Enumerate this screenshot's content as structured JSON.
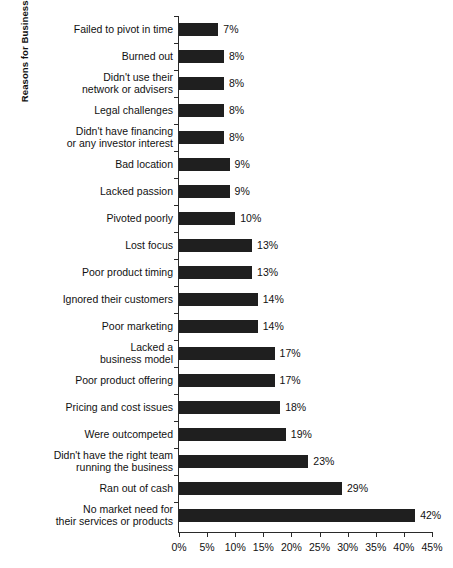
{
  "chart_data": {
    "type": "bar",
    "orientation": "horizontal",
    "title": "",
    "xlabel": "",
    "ylabel": "Reasons for Business Failure",
    "xlim": [
      0,
      45
    ],
    "xtick_labels": [
      "0%",
      "5%",
      "10%",
      "15%",
      "20%",
      "25%",
      "30%",
      "35%",
      "40%",
      "45%"
    ],
    "xtick_values": [
      0,
      5,
      10,
      15,
      20,
      25,
      30,
      35,
      40,
      45
    ],
    "grid": false,
    "legend": "none",
    "bar_color": "#1f1f1f",
    "categories": [
      "Failed to pivot in time",
      "Burned out",
      "Didn't use their\nnetwork or advisers",
      "Legal challenges",
      "Didn't have financing\nor any investor interest",
      "Bad location",
      "Lacked passion",
      "Pivoted poorly",
      "Lost focus",
      "Poor product timing",
      "Ignored their customers",
      "Poor marketing",
      "Lacked a\nbusiness model",
      "Poor product offering",
      "Pricing and cost issues",
      "Were outcompeted",
      "Didn't have the right team\nrunning the business",
      "Ran out of cash",
      "No market need for\ntheir services or products"
    ],
    "values": [
      7,
      8,
      8,
      8,
      8,
      9,
      9,
      10,
      13,
      13,
      14,
      14,
      17,
      17,
      18,
      19,
      23,
      29,
      42
    ],
    "data_labels": [
      "7%",
      "8%",
      "8%",
      "8%",
      "8%",
      "9%",
      "9%",
      "10%",
      "13%",
      "13%",
      "14%",
      "14%",
      "17%",
      "17%",
      "18%",
      "19%",
      "23%",
      "29%",
      "42%"
    ]
  }
}
